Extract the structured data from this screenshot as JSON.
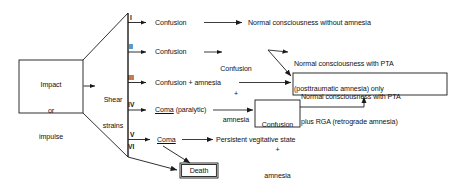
{
  "figure": {
    "line_color": "#1a1a1a",
    "text_color": "#111111",
    "background": "#ffffff"
  },
  "source_box": {
    "line1": "Impact",
    "line2": "or",
    "line3": "impulse"
  },
  "mechanism": {
    "line1": "Shear",
    "line2": "strains"
  },
  "grades": [
    {
      "numeral": "I",
      "state": "Confusion"
    },
    {
      "numeral": "II",
      "state": "Confusion"
    },
    {
      "numeral": "III",
      "state": "Confusion + amnesia"
    },
    {
      "numeral": "IV",
      "state": "Coma (paralytic)"
    },
    {
      "numeral": "V",
      "state": "Coma"
    },
    {
      "numeral": "VI",
      "state": ""
    }
  ],
  "intermediate_grade2": {
    "line1": "Confusion",
    "line2": "+",
    "line3": "amnesia"
  },
  "intermediate_grade4_box": {
    "line1": "Confusion",
    "line2": "+",
    "line3": "amnesia"
  },
  "outcomes": {
    "grade1": "Normal consciousness without amnesia",
    "pta_only_line1": "Normal consciousness with PTA",
    "pta_only_line2": "(posttraumatic amnesia) only",
    "pta_rga_line1": "Normal consciousness with PTA",
    "pta_rga_line2": "plus RGA (retrograde amnesia)",
    "vegetative": "Persistent vegitative state",
    "death": "Death"
  }
}
